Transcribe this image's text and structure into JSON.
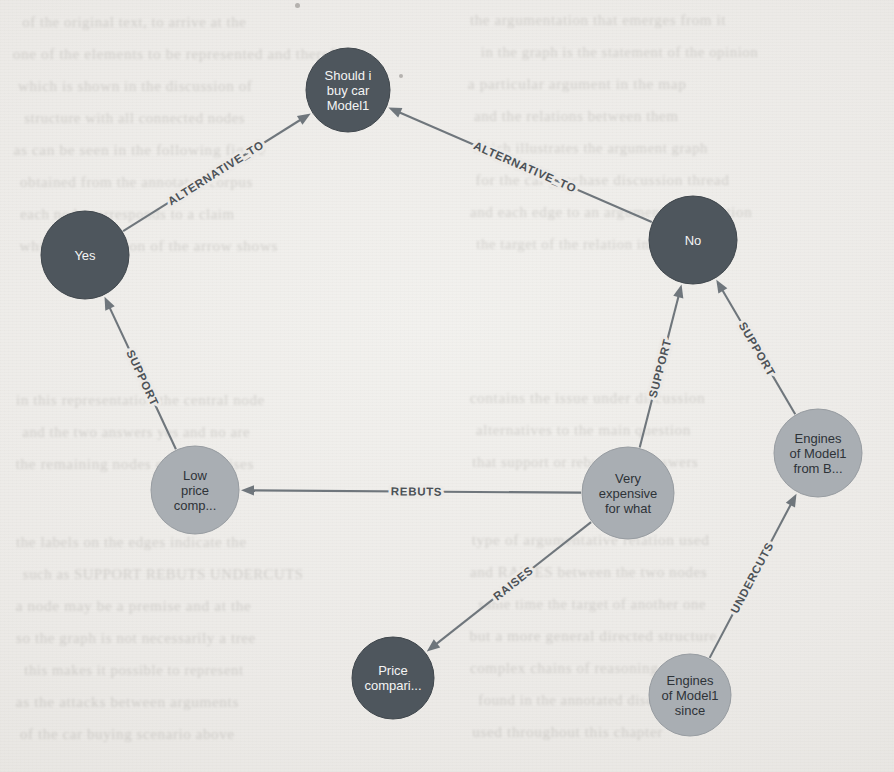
{
  "canvas": {
    "width": 894,
    "height": 772,
    "background": "#eceae7"
  },
  "palette": {
    "node_dark": "#4e565d",
    "node_light": "#a9aeb3",
    "label_on_dark": "#f4f4f4",
    "label_on_light": "#2e3338",
    "edge": "#6f767c",
    "paper": "#eceae7"
  },
  "graph": {
    "type": "argument-map",
    "nodes": [
      {
        "id": "root",
        "label": "Should i buy car Model1",
        "lines": [
          "Should i",
          "buy car",
          "Model1"
        ],
        "x": 348,
        "y": 90,
        "r": 42,
        "style": "dark"
      },
      {
        "id": "yes",
        "label": "Yes",
        "lines": [
          "Yes"
        ],
        "x": 85,
        "y": 255,
        "r": 44,
        "style": "dark"
      },
      {
        "id": "no",
        "label": "No",
        "lines": [
          "No"
        ],
        "x": 693,
        "y": 240,
        "r": 44,
        "style": "dark"
      },
      {
        "id": "lowprice",
        "label": "Low price comp...",
        "lines": [
          "Low",
          "price",
          "comp..."
        ],
        "x": 195,
        "y": 490,
        "r": 44,
        "style": "light"
      },
      {
        "id": "veryexp",
        "label": "Very expensive for what",
        "lines": [
          "Very",
          "expensive",
          "for what"
        ],
        "x": 628,
        "y": 493,
        "r": 46,
        "style": "light"
      },
      {
        "id": "enginesb",
        "label": "Engines of Model1 from B...",
        "lines": [
          "Engines",
          "of Model1",
          "from B..."
        ],
        "x": 818,
        "y": 453,
        "r": 44,
        "style": "light"
      },
      {
        "id": "pricecmp",
        "label": "Price compari...",
        "lines": [
          "Price",
          "compari..."
        ],
        "x": 393,
        "y": 678,
        "r": 41,
        "style": "dark"
      },
      {
        "id": "enginessi",
        "label": "Engines of Model1 since",
        "lines": [
          "Engines",
          "of Model1",
          "since"
        ],
        "x": 690,
        "y": 695,
        "r": 41,
        "style": "light"
      }
    ],
    "edges": [
      {
        "id": "e1",
        "label": "ALTERNATIVE_TO",
        "source": "yes",
        "target": "root",
        "label_pos": 0.52
      },
      {
        "id": "e2",
        "label": "ALTERNATIVE_TO",
        "source": "no",
        "target": "root",
        "label_pos": 0.5
      },
      {
        "id": "e3",
        "label": "SUPPORT",
        "source": "lowprice",
        "target": "yes",
        "label_pos": 0.5
      },
      {
        "id": "e4",
        "label": "SUPPORT",
        "source": "veryexp",
        "target": "no",
        "label_pos": 0.52
      },
      {
        "id": "e5",
        "label": "SUPPORT",
        "source": "enginesb",
        "target": "no",
        "label_pos": 0.52
      },
      {
        "id": "e6",
        "label": "REBUTS",
        "source": "veryexp",
        "target": "lowprice",
        "label_pos": 0.5
      },
      {
        "id": "e7",
        "label": "RAISES",
        "source": "veryexp",
        "target": "pricecmp",
        "label_pos": 0.5
      },
      {
        "id": "e8",
        "label": "UNDERCUTS",
        "source": "enginessi",
        "target": "enginesb",
        "label_pos": 0.52
      }
    ]
  },
  "background_bleed": [
    {
      "text": "of the original text, to arrive at the",
      "x": 20,
      "y": 14,
      "size": 15
    },
    {
      "text": "the argumentation that emerges from it",
      "x": 470,
      "y": 12,
      "size": 15
    },
    {
      "text": "one of the elements to be represented and therefore",
      "x": 16,
      "y": 46,
      "size": 15
    },
    {
      "text": "in the graph is the statement of the opinion",
      "x": 478,
      "y": 44,
      "size": 15
    },
    {
      "text": "which is shown in the discussion of",
      "x": 18,
      "y": 78,
      "size": 15
    },
    {
      "text": "a particular argument in the map",
      "x": 470,
      "y": 76,
      "size": 15
    },
    {
      "text": "structure with all connected nodes",
      "x": 22,
      "y": 110,
      "size": 15
    },
    {
      "text": "and the relations between them",
      "x": 474,
      "y": 108,
      "size": 15
    },
    {
      "text": "as can be seen in the following figure",
      "x": 16,
      "y": 142,
      "size": 15
    },
    {
      "text": "which illustrates the argument graph",
      "x": 470,
      "y": 140,
      "size": 15
    },
    {
      "text": "obtained from the annotated corpus",
      "x": 20,
      "y": 174,
      "size": 15
    },
    {
      "text": "for the car purchase discussion thread",
      "x": 478,
      "y": 172,
      "size": 15
    },
    {
      "text": "each node corresponds to a claim",
      "x": 18,
      "y": 206,
      "size": 15
    },
    {
      "text": "and each edge to an argumentative relation",
      "x": 470,
      "y": 204,
      "size": 15
    },
    {
      "text": "while the direction of the arrow shows",
      "x": 22,
      "y": 238,
      "size": 15
    },
    {
      "text": "the target of the relation in question",
      "x": 474,
      "y": 236,
      "size": 15
    },
    {
      "text": "in this representation the central node",
      "x": 16,
      "y": 392,
      "size": 15
    },
    {
      "text": "contains the issue under discussion",
      "x": 472,
      "y": 390,
      "size": 15
    },
    {
      "text": "and the two answers yes and no are",
      "x": 20,
      "y": 424,
      "size": 15
    },
    {
      "text": "alternatives to the main question",
      "x": 476,
      "y": 422,
      "size": 15
    },
    {
      "text": "the remaining nodes carry premises",
      "x": 18,
      "y": 456,
      "size": 15
    },
    {
      "text": "that support or rebut those answers",
      "x": 470,
      "y": 454,
      "size": 15
    },
    {
      "text": "the labels on the edges indicate the",
      "x": 16,
      "y": 534,
      "size": 15
    },
    {
      "text": "type of argumentative relation used",
      "x": 474,
      "y": 532,
      "size": 15
    },
    {
      "text": "such as SUPPORT REBUTS UNDERCUTS",
      "x": 20,
      "y": 566,
      "size": 15
    },
    {
      "text": "and RAISES between the two nodes",
      "x": 470,
      "y": 564,
      "size": 15
    },
    {
      "text": "a node may be a premise and at the",
      "x": 18,
      "y": 598,
      "size": 15
    },
    {
      "text": "same time the target of another one",
      "x": 476,
      "y": 596,
      "size": 15
    },
    {
      "text": "so the graph is not necessarily a tree",
      "x": 16,
      "y": 630,
      "size": 15
    },
    {
      "text": "but a more general directed structure",
      "x": 472,
      "y": 628,
      "size": 15
    },
    {
      "text": "this makes it possible to represent",
      "x": 22,
      "y": 662,
      "size": 15
    },
    {
      "text": "complex chains of reasoning as well",
      "x": 470,
      "y": 660,
      "size": 15
    },
    {
      "text": "as the attacks between arguments",
      "x": 18,
      "y": 694,
      "size": 15
    },
    {
      "text": "found in the annotated discussion",
      "x": 476,
      "y": 692,
      "size": 15
    },
    {
      "text": "of the car buying scenario above",
      "x": 20,
      "y": 726,
      "size": 15
    },
    {
      "text": "used throughout this chapter",
      "x": 474,
      "y": 724,
      "size": 15
    }
  ],
  "specks": [
    {
      "x": 399,
      "y": 74,
      "size": 4
    },
    {
      "x": 295,
      "y": 3,
      "size": 5
    }
  ]
}
